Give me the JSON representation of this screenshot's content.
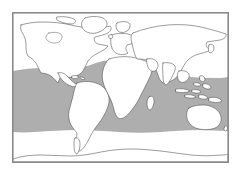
{
  "figure": {
    "kind": "world-distribution-map",
    "title": "",
    "caption": "",
    "background_color": "#ffffff",
    "frame": {
      "visible": true,
      "border_color": "#8a8a8a",
      "fill_color": "#ffffff",
      "x": 12,
      "y": 12,
      "width": 217,
      "height": 151
    }
  },
  "map": {
    "projection": "equirectangular",
    "land_fill": "#ffffff",
    "land_outline": "#4a4a4a",
    "ocean_fill": "#ffffff",
    "graticule": "none",
    "labels": [],
    "landmasses": [
      "North America",
      "Greenland",
      "South America",
      "Europe",
      "Africa",
      "Madagascar",
      "Asia",
      "Southeast Asian Archipelago",
      "Australia",
      "New Zealand",
      "Japan",
      "Antarctica"
    ]
  },
  "distribution_band": {
    "label": "shaded range band",
    "fill_color": "#aeaeae",
    "edge_color": "#aeaeae",
    "description": "Continuous shaded latitudinal band spanning all oceans and continents across the tropics and subtropics",
    "north_edge_note": "Dips lowest over the eastern Pacific and rises over the North Atlantic and western Pacific",
    "south_edge_note": "Roughly level, passing south of Australia and across southern South America"
  },
  "chart_data": {
    "type": "map",
    "title": "",
    "xlabel": "",
    "ylabel": "",
    "series": [
      {
        "name": "shaded range band",
        "color": "#aeaeae",
        "coverage": "global latitudinal band"
      }
    ]
  }
}
